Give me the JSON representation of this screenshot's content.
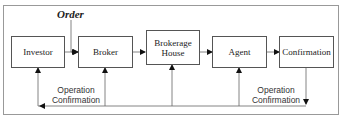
{
  "diagram": {
    "title_label": "Order",
    "nodes": [
      {
        "id": "investor",
        "label": "Investor"
      },
      {
        "id": "broker",
        "label": "Broker"
      },
      {
        "id": "brokerage_house",
        "label": "Brokerage House"
      },
      {
        "id": "agent",
        "label": "Agent"
      },
      {
        "id": "confirmation",
        "label": "Confirmation"
      }
    ],
    "edges": [
      {
        "from": "order",
        "to": "broker"
      },
      {
        "from": "investor",
        "to": "broker"
      },
      {
        "from": "broker",
        "to": "brokerage_house"
      },
      {
        "from": "brokerage_house",
        "to": "agent"
      },
      {
        "from": "agent",
        "to": "confirmation"
      },
      {
        "from": "confirmation",
        "to": "feedback_line"
      },
      {
        "from": "feedback_line",
        "to": "investor"
      },
      {
        "from": "feedback_line",
        "to": "broker"
      },
      {
        "from": "feedback_line",
        "to": "brokerage_house"
      },
      {
        "from": "feedback_line",
        "to": "agent"
      }
    ],
    "feedback_labels": {
      "left": "Operation Confirmation",
      "right": "Operation Confirmation"
    }
  }
}
